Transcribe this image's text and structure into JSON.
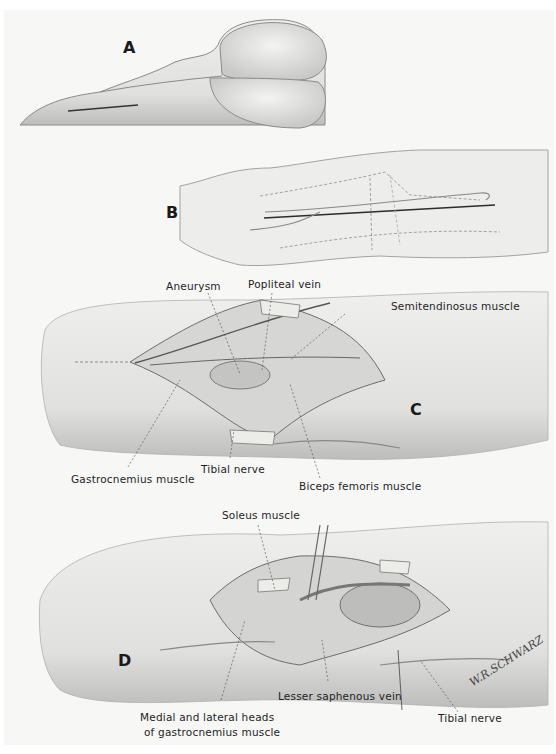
{
  "figure": {
    "panels": [
      {
        "id": "A",
        "letter": "A",
        "description": "Patient prone; incision over posterior calf"
      },
      {
        "id": "B",
        "letter": "B",
        "description": "Leg outline with dashed vessel/incision course"
      },
      {
        "id": "C",
        "letter": "C",
        "description": "Popliteal fossa exposure",
        "labels": {
          "aneurysm": "Aneurysm",
          "popliteal_vein": "Popliteal vein",
          "semitendinosus": "Semitendinosus muscle",
          "gastrocnemius": "Gastrocnemius muscle",
          "tibial_nerve": "Tibial nerve",
          "biceps_femoris": "Biceps femoris muscle"
        }
      },
      {
        "id": "D",
        "letter": "D",
        "description": "Distal exposure with retractors",
        "labels": {
          "soleus": "Soleus muscle",
          "lesser_saphenous": "Lesser saphenous vein",
          "tibial_nerve": "Tibial nerve",
          "medial_lateral_heads_line1": "Medial and lateral heads",
          "medial_lateral_heads_line2": "of gastrocnemius muscle"
        }
      }
    ],
    "signature": "W.R.SCHWARZ"
  }
}
